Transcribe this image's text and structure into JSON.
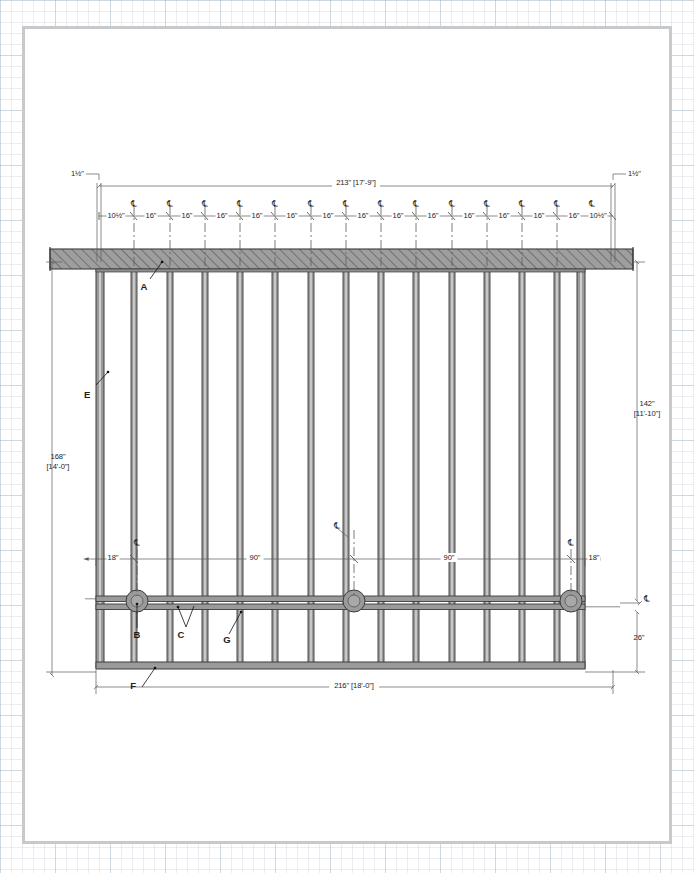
{
  "sheet": {
    "title": "structural-elevation-drawing"
  },
  "drawing": {
    "type": "structural elevation",
    "overall": {
      "top_beam_dim": "213\" [17'-9\"]",
      "bottom_dim": "216\" [18'-0\"]",
      "left_height": "168\"",
      "left_height_ft": "[14'-0\"]",
      "right_height": "142\"",
      "right_height_ft": "[11'-10\"]",
      "bottom_right_dim": "26\""
    },
    "overhang": {
      "left": "1½\"",
      "right": "1½\""
    },
    "top_chain": {
      "labels": [
        "10½\"",
        "16\"",
        "16\"",
        "16\"",
        "16\"",
        "16\"",
        "16\"",
        "16\"",
        "16\"",
        "16\"",
        "16\"",
        "16\"",
        "16\"",
        "16\"",
        "10½\""
      ],
      "centerline_symbol": "℄",
      "post_count": 14
    },
    "mid_chain": {
      "labels": [
        "18\"",
        "90\"",
        "90\"",
        "18\""
      ],
      "centerline_symbol": "℄"
    },
    "callouts": [
      {
        "id": "A",
        "label": "A"
      },
      {
        "id": "B",
        "label": "B"
      },
      {
        "id": "C",
        "label": "C"
      },
      {
        "id": "E",
        "label": "E"
      },
      {
        "id": "F",
        "label": "F"
      },
      {
        "id": "G",
        "label": "G"
      }
    ],
    "colors": {
      "member_fill": "#9a9a9a",
      "member_stroke": "#3c3c3c",
      "dimension_line": "#5a5a5a",
      "text": "#1d1d1d",
      "sheet_border": "#c9c9c9",
      "grid": "#96aabe"
    }
  }
}
